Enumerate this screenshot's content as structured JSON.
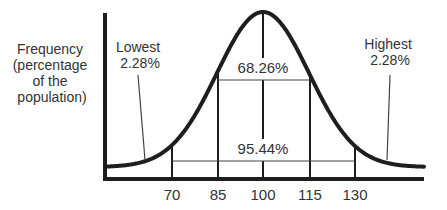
{
  "diagram": {
    "type": "normal-distribution",
    "y_axis_label": [
      "Frequency",
      "(percentage",
      "of the",
      "population)"
    ],
    "x_ticks": [
      "70",
      "85",
      "100",
      "115",
      "130"
    ],
    "regions": {
      "center": {
        "label": "68.26%",
        "from": "85",
        "to": "115"
      },
      "wide": {
        "label": "95.44%",
        "from": "70",
        "to": "130"
      },
      "lowest": {
        "title": "Lowest",
        "value": "2.28%"
      },
      "highest": {
        "title": "Highest",
        "value": "2.28%"
      }
    }
  },
  "colors": {
    "line": "#1e1e1e",
    "text": "#333333",
    "thin": "#444444"
  }
}
